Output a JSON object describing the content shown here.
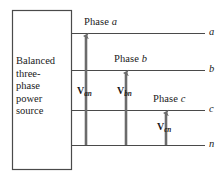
{
  "figure": {
    "name": "balanced-three-phase-source-line-diagram",
    "width": 220,
    "height": 180,
    "background": "#ffffff",
    "line_color": "#4a4a4a",
    "arrow_color": "#6b6b6b",
    "text_color": "#1a1a1a"
  },
  "source_box": {
    "label_lines": [
      "Balanced",
      "three-",
      "phase",
      "power",
      "source"
    ],
    "x": 12,
    "y": 10,
    "width": 60,
    "height": 160
  },
  "conductors": [
    {
      "id": "a",
      "terminal_label": "a",
      "y": 33,
      "x_start": 72,
      "x_end": 205
    },
    {
      "id": "b",
      "terminal_label": "b",
      "y": 70,
      "x_start": 72,
      "x_end": 205
    },
    {
      "id": "c",
      "terminal_label": "c",
      "y": 110,
      "x_start": 72,
      "x_end": 205
    },
    {
      "id": "n",
      "terminal_label": "n",
      "y": 145,
      "x_start": 72,
      "x_end": 205
    }
  ],
  "phase_labels": [
    {
      "id": "phase-a",
      "prefix": "Phase ",
      "italic": "a",
      "x": 84,
      "y": 17
    },
    {
      "id": "phase-b",
      "prefix": "Phase ",
      "italic": "b",
      "x": 114,
      "y": 54
    },
    {
      "id": "phase-c",
      "prefix": "Phase ",
      "italic": "c",
      "x": 153,
      "y": 94
    }
  ],
  "voltage_arrows": [
    {
      "id": "v-an",
      "symbol": "V",
      "subscript": "an",
      "x": 86,
      "y_tail": 145,
      "y_head": 36,
      "label_x": 77,
      "label_y": 86
    },
    {
      "id": "v-bn",
      "symbol": "V",
      "subscript": "bn",
      "x": 126,
      "y_tail": 145,
      "y_head": 73,
      "label_x": 117,
      "label_y": 86
    },
    {
      "id": "v-cn",
      "symbol": "V",
      "subscript": "cn",
      "x": 166,
      "y_tail": 145,
      "y_head": 113,
      "label_x": 157,
      "label_y": 122
    }
  ],
  "terminal_label_positions": [
    {
      "id": "terminal-a",
      "label": "a",
      "x": 209,
      "y": 27
    },
    {
      "id": "terminal-b",
      "label": "b",
      "x": 209,
      "y": 64
    },
    {
      "id": "terminal-c",
      "label": "c",
      "x": 209,
      "y": 104
    },
    {
      "id": "terminal-n",
      "label": "n",
      "x": 209,
      "y": 139
    }
  ]
}
